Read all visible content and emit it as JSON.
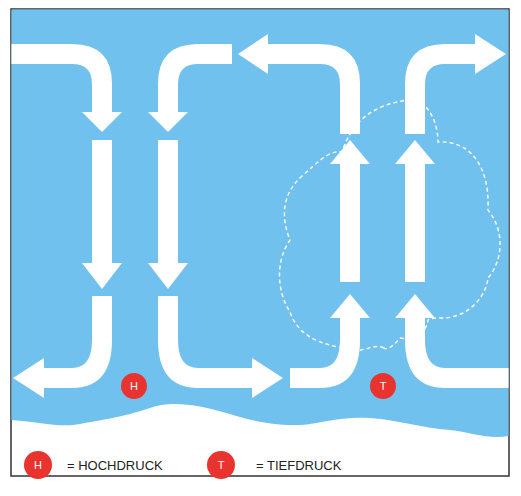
{
  "diagram": {
    "type": "atmospheric-circulation",
    "colors": {
      "sky": "#71c1ef",
      "arrow": "#ffffff",
      "ground": "#ffffff",
      "badge": "#e8332f",
      "frame": "#333333",
      "cloud_outline": "#ffffff"
    },
    "markers": [
      {
        "id": "high",
        "letter": "H",
        "meaning": "Hochdruck"
      },
      {
        "id": "low",
        "letter": "T",
        "meaning": "Tiefdruck"
      }
    ],
    "flows": [
      {
        "name": "left-descending-flow",
        "direction": "down",
        "top": "from left",
        "bottom": "to left"
      },
      {
        "name": "center-left-descending-flow",
        "direction": "down",
        "top": "from right",
        "bottom": "to right"
      },
      {
        "name": "center-right-ascending-flow",
        "direction": "up",
        "top": "to left",
        "bottom": "from left"
      },
      {
        "name": "right-ascending-flow",
        "direction": "up",
        "top": "to right",
        "bottom": "from right"
      }
    ]
  },
  "legend": {
    "high_letter": "H",
    "high_label": "= HOCHDRUCK",
    "low_letter": "T",
    "low_label": "= TIEFDRUCK"
  },
  "badges": {
    "high": "H",
    "low": "T"
  }
}
